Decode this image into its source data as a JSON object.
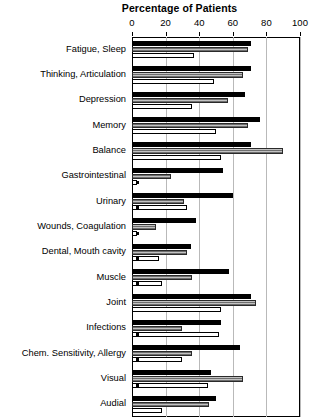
{
  "chart_data": {
    "type": "bar",
    "orientation": "horizontal",
    "title": "Percentage of Patients",
    "xlabel": "Percentage of Patients",
    "ylabel": "",
    "xlim": [
      0,
      100
    ],
    "xticks": [
      0,
      20,
      40,
      60,
      80,
      100
    ],
    "xtick_labels": [
      "0",
      "20",
      "40",
      "60",
      "80",
      "100"
    ],
    "grid": "vertical",
    "legend_position": "none",
    "categories": [
      "Fatigue, Sleep",
      "Thinking, Articulation",
      "Depression",
      "Memory",
      "Balance",
      "Gastrointestinal",
      "Urinary",
      "Wounds, Coagulation",
      "Dental, Mouth cavity",
      "Muscle",
      "Joint",
      "Infections",
      "Chem. Sensitivity, Allergy",
      "Visual",
      "Audial"
    ],
    "series": [
      {
        "name": "Series 1",
        "style": "black",
        "values": [
          71,
          71,
          67,
          76,
          71,
          54,
          60,
          38,
          35,
          58,
          71,
          53,
          64,
          47,
          50
        ]
      },
      {
        "name": "Series 2",
        "style": "gray-hatched",
        "values": [
          69,
          66,
          57,
          69,
          90,
          23,
          31,
          14,
          33,
          36,
          74,
          30,
          36,
          66,
          46
        ]
      },
      {
        "name": "Series 3",
        "style": "white",
        "values": [
          37,
          49,
          36,
          50,
          53,
          3,
          33,
          3,
          16,
          18,
          53,
          52,
          30,
          45,
          18
        ]
      }
    ],
    "markers": {
      "note": "small square significance markers on the third bar",
      "categories_with_marker": [
        "Gastrointestinal",
        "Urinary",
        "Wounds, Coagulation",
        "Dental, Mouth cavity",
        "Muscle",
        "Infections",
        "Chem. Sensitivity, Allergy",
        "Visual"
      ]
    }
  }
}
